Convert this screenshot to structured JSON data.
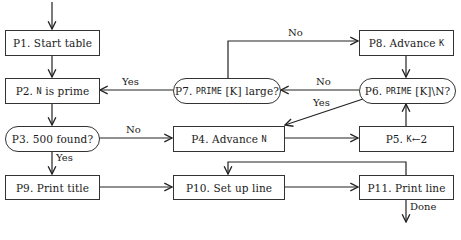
{
  "diagram": {
    "type": "flowchart",
    "nodes": [
      {
        "id": "P1",
        "shape": "box",
        "prefix": "P1.",
        "text": "Start table"
      },
      {
        "id": "P2",
        "shape": "box",
        "prefix": "P2.",
        "code": "N",
        "text": "is prime"
      },
      {
        "id": "P3",
        "shape": "decision",
        "prefix": "P3.",
        "text": "500 found?"
      },
      {
        "id": "P4",
        "shape": "box",
        "prefix": "P4.",
        "text": "Advance",
        "code": "N"
      },
      {
        "id": "P5",
        "shape": "box",
        "prefix": "P5.",
        "code": "K",
        "text": "←2"
      },
      {
        "id": "P6",
        "shape": "decision",
        "prefix": "P6.",
        "code": "PRIME",
        "text": "[K]\\N?"
      },
      {
        "id": "P7",
        "shape": "decision",
        "prefix": "P7.",
        "code": "PRIME",
        "text": "[K] large?"
      },
      {
        "id": "P8",
        "shape": "box",
        "prefix": "P8.",
        "text": "Advance",
        "code": "K"
      },
      {
        "id": "P9",
        "shape": "box",
        "prefix": "P9.",
        "text": "Print title"
      },
      {
        "id": "P10",
        "shape": "box",
        "prefix": "P10.",
        "text": "Set up line"
      },
      {
        "id": "P11",
        "shape": "box",
        "prefix": "P11.",
        "text": "Print line"
      }
    ],
    "edges": [
      {
        "from": "start",
        "to": "P1",
        "label": ""
      },
      {
        "from": "P1",
        "to": "P2",
        "label": ""
      },
      {
        "from": "P2",
        "to": "P3",
        "label": ""
      },
      {
        "from": "P3",
        "to": "P9",
        "label": "Yes"
      },
      {
        "from": "P3",
        "to": "P4",
        "label": "No"
      },
      {
        "from": "P4",
        "to": "P5",
        "label": ""
      },
      {
        "from": "P5",
        "to": "P6",
        "label": ""
      },
      {
        "from": "P6",
        "to": "P7",
        "label": "No"
      },
      {
        "from": "P6",
        "to": "P4",
        "label": "Yes"
      },
      {
        "from": "P7",
        "to": "P2",
        "label": "Yes"
      },
      {
        "from": "P7",
        "to": "P8",
        "label": "No"
      },
      {
        "from": "P8",
        "to": "P6",
        "label": ""
      },
      {
        "from": "P9",
        "to": "P10",
        "label": ""
      },
      {
        "from": "P10",
        "to": "P11",
        "label": ""
      },
      {
        "from": "P11",
        "to": "P10",
        "label": ""
      },
      {
        "from": "P11",
        "to": "end",
        "label": "Done"
      }
    ],
    "labels": {
      "yes": "Yes",
      "no": "No",
      "done": "Done"
    }
  }
}
